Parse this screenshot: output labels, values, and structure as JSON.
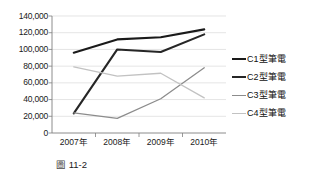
{
  "caption": {
    "tag": "圖",
    "number": "11-2"
  },
  "legend": {
    "position": "right",
    "entries": [
      {
        "label": "C1型筆電",
        "color": "#1a1a1a",
        "width": 2.1
      },
      {
        "label": "C2型筆電",
        "color": "#262626",
        "width": 2.1
      },
      {
        "label": "C3型筆電",
        "color": "#8c8c8c",
        "width": 1.3
      },
      {
        "label": "C4型筆電",
        "color": "#c2c2c2",
        "width": 1.3
      }
    ]
  },
  "axes": {
    "y_ticks": [
      "140,000",
      "120,000",
      "100,000",
      "80,000",
      "60,000",
      "40,000",
      "20,000",
      "0"
    ],
    "x_ticks": [
      "2007年",
      "2008年",
      "2009年",
      "2010年"
    ]
  },
  "chart_data": {
    "type": "line",
    "title": "",
    "subtitle": "",
    "xlabel": "",
    "ylabel": "",
    "categories": [
      "2007年",
      "2008年",
      "2009年",
      "2010年"
    ],
    "ylim": [
      0,
      140000
    ],
    "ytick_interval": 20000,
    "grid": true,
    "grid_orientation": "horizontal",
    "legend_position": "right",
    "series": [
      {
        "name": "C1型筆電",
        "color": "#1a1a1a",
        "width": 2.1,
        "values": [
          96000,
          112000,
          114500,
          124000
        ]
      },
      {
        "name": "C2型筆電",
        "color": "#262626",
        "width": 2.1,
        "values": [
          23500,
          100000,
          97000,
          118000
        ]
      },
      {
        "name": "C3型筆電",
        "color": "#8c8c8c",
        "width": 1.3,
        "values": [
          24000,
          17500,
          41000,
          78000
        ]
      },
      {
        "name": "C4型筆電",
        "color": "#c2c2c2",
        "width": 1.3,
        "values": [
          79000,
          68000,
          71500,
          42000
        ]
      }
    ]
  },
  "style": {
    "grid_color": "#d9d9d9",
    "axis_color": "#7f7f7f",
    "plot_background": "#ffffff"
  }
}
